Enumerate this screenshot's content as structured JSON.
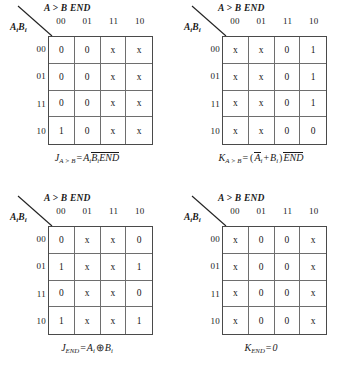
{
  "page": {
    "background_color": "#ffffff",
    "grid_line_color": "#6e6e6e",
    "border_color": "#4a4a4a"
  },
  "common": {
    "top_variable_label": "A > B END",
    "left_variable_label": "AᵢBᵢ",
    "left_variable_base": "A",
    "left_variable_base2": "B",
    "left_variable_sub": "i",
    "column_headers": [
      "00",
      "01",
      "11",
      "10"
    ],
    "row_headers": [
      "00",
      "01",
      "11",
      "10"
    ],
    "diagonal_icon": "diagonal-divider"
  },
  "maps": [
    {
      "id": "j-a-greater-b",
      "position": "top-left",
      "cells": [
        [
          "0",
          "0",
          "x",
          "x"
        ],
        [
          "0",
          "0",
          "x",
          "x"
        ],
        [
          "0",
          "0",
          "x",
          "x"
        ],
        [
          "1",
          "0",
          "x",
          "x"
        ]
      ],
      "caption": {
        "lhs": "J",
        "lhs_sub": "A > B",
        "eq": "=",
        "terms": [
          {
            "text": "A",
            "sub": "i",
            "overbar": false
          },
          {
            "text": "B",
            "sub": "i",
            "overbar": true
          },
          {
            "text": "END",
            "sub": "",
            "overbar": true
          }
        ],
        "plain": "J(A>B) = Ai Bi' END'"
      }
    },
    {
      "id": "k-a-greater-b",
      "position": "top-right",
      "cells": [
        [
          "x",
          "x",
          "0",
          "1"
        ],
        [
          "x",
          "x",
          "0",
          "1"
        ],
        [
          "x",
          "x",
          "0",
          "1"
        ],
        [
          "x",
          "x",
          "0",
          "0"
        ]
      ],
      "caption": {
        "lhs": "K",
        "lhs_sub": "A > B",
        "eq": "=",
        "open_paren": "(",
        "close_paren": ")",
        "plus": "+",
        "terms": [
          {
            "text": "A",
            "sub": "i",
            "overbar": true
          },
          {
            "text": "B",
            "sub": "i",
            "overbar": false
          },
          {
            "text": "END",
            "sub": "",
            "overbar": true
          }
        ],
        "plain": "K(A>B) = (Ai' + Bi) END'"
      }
    },
    {
      "id": "j-end",
      "position": "bottom-left",
      "cells": [
        [
          "0",
          "x",
          "x",
          "0"
        ],
        [
          "1",
          "x",
          "x",
          "1"
        ],
        [
          "0",
          "x",
          "x",
          "0"
        ],
        [
          "1",
          "x",
          "x",
          "1"
        ]
      ],
      "caption": {
        "lhs": "J",
        "lhs_sub": "END",
        "eq": "=",
        "xor": "⊕",
        "terms": [
          {
            "text": "A",
            "sub": "i",
            "overbar": false
          },
          {
            "text": "B",
            "sub": "i",
            "overbar": false
          }
        ],
        "plain": "J(END) = Ai XOR Bi"
      }
    },
    {
      "id": "k-end",
      "position": "bottom-right",
      "cells": [
        [
          "x",
          "0",
          "0",
          "x"
        ],
        [
          "x",
          "0",
          "0",
          "x"
        ],
        [
          "x",
          "0",
          "0",
          "x"
        ],
        [
          "x",
          "0",
          "0",
          "x"
        ]
      ],
      "caption": {
        "lhs": "K",
        "lhs_sub": "END",
        "eq": "=",
        "value": "0",
        "plain": "K(END) = 0"
      }
    }
  ]
}
